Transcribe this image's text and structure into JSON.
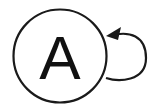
{
  "diagram": {
    "type": "state-diagram",
    "nodes": [
      {
        "id": "A",
        "label": "A",
        "shape": "circle"
      }
    ],
    "edges": [
      {
        "from": "A",
        "to": "A",
        "type": "self-loop",
        "side": "right",
        "arrow": "end"
      }
    ],
    "colors": {
      "stroke": "#1a1a1a",
      "background": "#ffffff",
      "text": "#111111"
    }
  }
}
